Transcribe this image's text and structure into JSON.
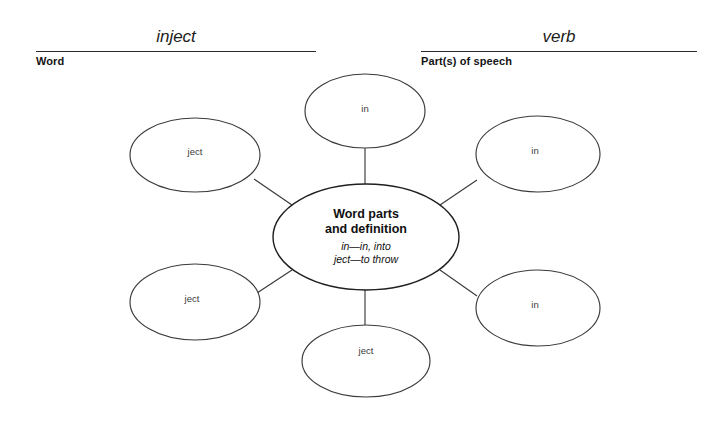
{
  "worksheet": {
    "fields": [
      {
        "id": "word",
        "answer": "inject",
        "caption": "Word"
      },
      {
        "id": "parts-of-speech",
        "answer": "verb",
        "caption": "Part(s) of speech"
      }
    ]
  },
  "diagram": {
    "type": "word-map",
    "center": {
      "title_line1": "Word parts",
      "title_line2": "and definition",
      "definition_line1": "in—in, into",
      "definition_line2": "ject—to throw"
    },
    "nodes": [
      {
        "id": "node-top",
        "label": "in",
        "position": "top"
      },
      {
        "id": "node-upper-left",
        "label": "ject",
        "position": "upper-left"
      },
      {
        "id": "node-upper-right",
        "label": "in",
        "position": "upper-right"
      },
      {
        "id": "node-lower-left",
        "label": "ject",
        "position": "lower-left"
      },
      {
        "id": "node-lower-right",
        "label": "in",
        "position": "lower-right"
      },
      {
        "id": "node-bottom",
        "label": "ject",
        "position": "bottom"
      }
    ]
  },
  "colors": {
    "background": "#ffffff",
    "stroke": "#3a3a3a",
    "center_stroke": "#1f1f1f",
    "rule": "#2b2b2b",
    "text": "#1a1a1a",
    "node_text": "#3b3b3b"
  }
}
